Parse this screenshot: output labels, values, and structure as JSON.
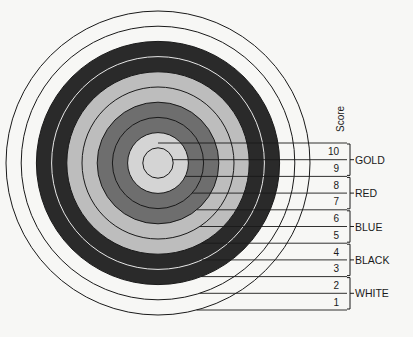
{
  "diagram": {
    "score_header": "Score",
    "rings": [
      {
        "score": 1,
        "color_name": "WHITE",
        "fill": "#f7f7f5"
      },
      {
        "score": 2,
        "color_name": "WHITE",
        "fill": "#f7f7f5"
      },
      {
        "score": 3,
        "color_name": "BLACK",
        "fill": "#2a2a2a"
      },
      {
        "score": 4,
        "color_name": "BLACK",
        "fill": "#2a2a2a"
      },
      {
        "score": 5,
        "color_name": "BLUE",
        "fill": "#bdbdbd"
      },
      {
        "score": 6,
        "color_name": "BLUE",
        "fill": "#bdbdbd"
      },
      {
        "score": 7,
        "color_name": "RED",
        "fill": "#6e6e6e"
      },
      {
        "score": 8,
        "color_name": "RED",
        "fill": "#6e6e6e"
      },
      {
        "score": 9,
        "color_name": "GOLD",
        "fill": "#d4d4d4"
      },
      {
        "score": 10,
        "color_name": "GOLD",
        "fill": "#d4d4d4"
      }
    ],
    "zones": [
      {
        "label": "GOLD",
        "scores": [
          10,
          9
        ]
      },
      {
        "label": "RED",
        "scores": [
          8,
          7
        ]
      },
      {
        "label": "BLUE",
        "scores": [
          6,
          5
        ]
      },
      {
        "label": "BLACK",
        "scores": [
          4,
          3
        ]
      },
      {
        "label": "WHITE",
        "scores": [
          2,
          1
        ]
      }
    ],
    "score_labels": [
      "10",
      "9",
      "8",
      "7",
      "6",
      "5",
      "4",
      "3",
      "2",
      "1"
    ]
  }
}
